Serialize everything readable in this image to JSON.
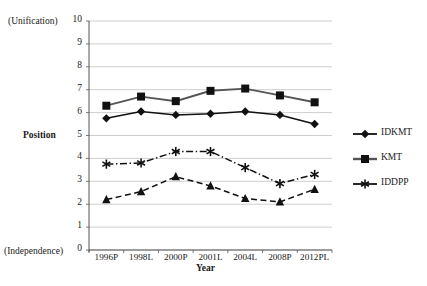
{
  "chart_data": {
    "type": "line",
    "title": "",
    "xlabel": "Year",
    "ylabel": "Position",
    "ylim": [
      0,
      10
    ],
    "ytick_values": [
      0,
      1,
      2,
      3,
      4,
      5,
      6,
      7,
      8,
      9,
      10
    ],
    "ytick_labels": [
      "0",
      "1",
      "2",
      "3",
      "4",
      "5",
      "6",
      "7",
      "8",
      "9",
      "10"
    ],
    "y_axis_top_annotation": "(Unification)",
    "y_axis_bottom_annotation": "(Independence)",
    "grid": true,
    "legend_position": "right",
    "categories": [
      "1996P",
      "1998L",
      "2000P",
      "2001L",
      "2004L",
      "2008P",
      "2012PL"
    ],
    "series": [
      {
        "name": "IDKMT",
        "marker": "diamond",
        "linestyle": "solid",
        "color": "#111111",
        "in_legend": true,
        "values": [
          5.75,
          6.05,
          5.9,
          5.95,
          6.05,
          5.9,
          5.5
        ]
      },
      {
        "name": "KMT",
        "marker": "square",
        "linestyle": "solid",
        "color": "#555555",
        "in_legend": true,
        "values": [
          6.3,
          6.7,
          6.5,
          6.95,
          7.05,
          6.75,
          6.45
        ]
      },
      {
        "name": "IDDPP",
        "marker": "star",
        "linestyle": "dashdot",
        "color": "#111111",
        "in_legend": true,
        "values": [
          3.75,
          3.8,
          4.3,
          4.3,
          3.6,
          2.9,
          3.3
        ]
      },
      {
        "name": "DPP",
        "marker": "triangle",
        "linestyle": "dashed",
        "color": "#111111",
        "in_legend": false,
        "values": [
          2.2,
          2.55,
          3.2,
          2.8,
          2.25,
          2.1,
          2.65
        ]
      }
    ]
  },
  "axes": {
    "y_top_annotation": "(Unification)",
    "y_bottom_annotation": "(Independence)",
    "y_title": "Position",
    "x_title": "Year"
  },
  "legend": {
    "items": [
      {
        "label": "IDKMT"
      },
      {
        "label": "KMT"
      },
      {
        "label": "IDDPP"
      }
    ]
  },
  "colors": {
    "grid": "#b8b8b8",
    "axis": "#555555",
    "kmt_line": "#555555",
    "idkmt_line": "#111111",
    "iddpp_line": "#111111",
    "dpp_line": "#111111"
  }
}
